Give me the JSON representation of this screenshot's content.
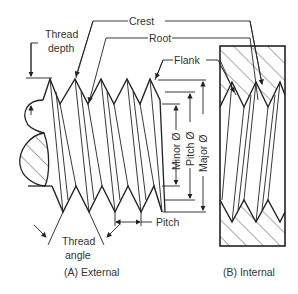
{
  "diagram": {
    "labels": {
      "crest": "Crest",
      "root": "Root",
      "flank": "Flank",
      "thread_depth_1": "Thread",
      "thread_depth_2": "depth",
      "minor_dia": "Minor Ø",
      "pitch_dia": "Pitch Ø",
      "major_dia": "Major Ø",
      "pitch": "Pitch",
      "thread_angle_1": "Thread",
      "thread_angle_2": "angle"
    },
    "captions": {
      "external": "(A) External",
      "internal": "(B) Internal"
    },
    "colors": {
      "line": "#222222",
      "text": "#333333",
      "background": "#ffffff"
    }
  }
}
